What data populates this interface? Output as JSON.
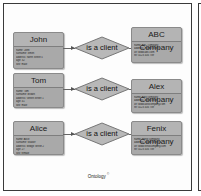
{
  "diagram": {
    "caption": "Ontology",
    "caption_mark": "©",
    "relation_label": "is a client",
    "rows": [
      {
        "person": {
          "name": "John",
          "attributes": [
            "name: John",
            "surname: Smith",
            "address: North Street 5",
            "age: 32",
            "sex: male"
          ]
        },
        "relation": "is a client",
        "company": {
          "name": "ABC Company",
          "attributes": [
            "name: ABC company",
            "address: Home Street",
            "url: www.abc.com",
            "tel: 0123 456 789"
          ]
        }
      },
      {
        "person": {
          "name": "Tom",
          "attributes": [
            "name: Tom",
            "surname: Brown",
            "address: Green Street 1",
            "age: 41",
            "sex: male"
          ]
        },
        "relation": "is a client",
        "company": {
          "name": "Alex Company",
          "attributes": [
            "name: Alex company",
            "address: West Street",
            "url: www.alexcompany.com",
            "tel: 0123 456 789"
          ]
        }
      },
      {
        "person": {
          "name": "Alice",
          "attributes": [
            "name: Alice",
            "surname: Walker",
            "address: Bridge Street 2",
            "age: 27",
            "sex: female"
          ]
        },
        "relation": "is a client",
        "company": {
          "name": "Fenix Company",
          "attributes": [
            "name: Fenix company",
            "address: South Street 3",
            "url: www.fenixcompany.com",
            "tel: 0123 456 789"
          ]
        }
      }
    ]
  },
  "colors": {
    "entity_fill": "#a9a9a9",
    "diamond_fill": "#b8b8b8",
    "border": "#3a3a3a"
  }
}
